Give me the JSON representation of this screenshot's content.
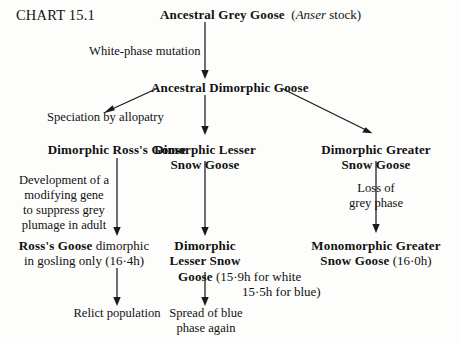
{
  "chart": {
    "id_label": "CHART 15.1",
    "nodes": {
      "root": {
        "name_bold": "Ancestral Grey Goose",
        "qualifier_italic": "Anser",
        "qualifier_rest": " stock)",
        "qualifier_open": "("
      },
      "dimorphic_ancestor": {
        "name_bold": "Ancestral Dimorphic Goose"
      },
      "ross": {
        "name_bold": "Dimorphic Ross's Goose"
      },
      "lesser": {
        "line1": "Dimorphic Lesser",
        "line2": "Snow Goose"
      },
      "greater": {
        "line1": "Dimorphic Greater",
        "line2": "Snow Goose"
      },
      "ross_final": {
        "bold": "Ross's Goose",
        "rest1": " dimorphic",
        "line2": "in gosling only (16·4h)"
      },
      "lesser_final": {
        "line1": "Dimorphic",
        "line2": "Lesser Snow",
        "line3_bold": "Goose",
        "line3_rest": " (15·9h for white",
        "line4": "15·5h for blue)"
      },
      "greater_final": {
        "line1": "Monomorphic Greater",
        "line2_bold": "Snow Goose",
        "line2_rest": " (16·0h)"
      },
      "relict": {
        "text": "Relict population"
      },
      "spread": {
        "line1": "Spread of blue",
        "line2": "phase again"
      }
    },
    "edge_labels": {
      "white_phase": "White-phase mutation",
      "speciation": "Speciation by allopatry",
      "modifying_gene_l1": "Development of a",
      "modifying_gene_l2": "modifying gene",
      "modifying_gene_l3": "to suppress grey",
      "modifying_gene_l4": "plumage in adult",
      "loss_grey_l1": "Loss of",
      "loss_grey_l2": "grey phase"
    }
  }
}
